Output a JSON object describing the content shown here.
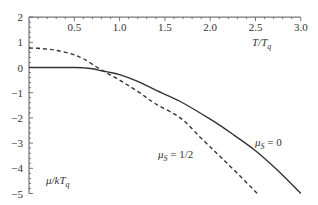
{
  "chart_data": {
    "type": "line",
    "title": "",
    "xlabel": "T/T_q",
    "ylabel": "μ/kT_q",
    "xlim": [
      0,
      3.0
    ],
    "ylim": [
      -5,
      2
    ],
    "x_ticks": [
      "0.5",
      "1.0",
      "1.5",
      "2.0",
      "2.5",
      "3.0"
    ],
    "y_ticks": [
      "2",
      "1",
      "0",
      "-1",
      "-2",
      "-3",
      "-4",
      "-5"
    ],
    "grid": false,
    "legend": "inline labels",
    "series": [
      {
        "name": "μ_S = 0",
        "style": "solid",
        "x": [
          0.0,
          0.3,
          0.5,
          0.6,
          0.7,
          0.8,
          0.9,
          1.0,
          1.2,
          1.4,
          1.67,
          2.0,
          2.25,
          2.5,
          2.75,
          3.0
        ],
        "y": [
          0.0,
          0.0,
          0.0,
          -0.01,
          -0.05,
          -0.13,
          -0.2,
          -0.28,
          -0.55,
          -0.9,
          -1.35,
          -2.05,
          -2.65,
          -3.3,
          -4.1,
          -5.0
        ]
      },
      {
        "name": "μ_S = 1/2",
        "style": "dashed",
        "x": [
          0.0,
          0.1,
          0.2,
          0.3,
          0.46,
          0.6,
          0.8,
          1.0,
          1.2,
          1.4,
          1.67,
          1.9,
          2.1,
          2.3,
          2.52
        ],
        "y": [
          0.77,
          0.76,
          0.73,
          0.68,
          0.55,
          0.35,
          -0.1,
          -0.5,
          -0.95,
          -1.45,
          -2.0,
          -2.8,
          -3.5,
          -4.2,
          -5.0
        ]
      }
    ],
    "annotations": [
      {
        "text": "μ_S = 0",
        "x": 2.55,
        "y": -3.05
      },
      {
        "text": "μ_S = 1/2",
        "x": 1.45,
        "y": -3.6
      }
    ]
  },
  "labels": {
    "x_axis_title": "T/T",
    "x_axis_sub": "q",
    "y_axis_title": "μ/kT",
    "y_axis_sub": "q",
    "curve0_mu": "μ",
    "curve0_sub": "S",
    "curve0_rest": " = 0",
    "curve1_mu": "μ",
    "curve1_sub": "S",
    "curve1_rest": " = 1/2"
  },
  "colors": {
    "axis": "#555555",
    "curve": "#333333"
  }
}
